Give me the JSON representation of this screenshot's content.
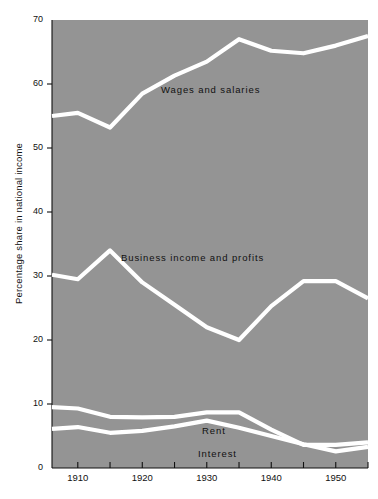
{
  "chart_data": {
    "type": "line",
    "title": "",
    "subtitle": "",
    "xlabel": "",
    "ylabel": "Percentage share in national income",
    "xlim": [
      1906,
      1955
    ],
    "ylim": [
      0,
      70
    ],
    "grid": false,
    "legend_position": "inline-annotations",
    "background_color": "#949494",
    "line_color": "#ffffff",
    "text_color": "#111111",
    "y_ticks": [
      0,
      10,
      20,
      30,
      40,
      50,
      60,
      70
    ],
    "y_tick_labels": [
      "0",
      "10",
      "20",
      "30",
      "40",
      "50",
      "60",
      "70"
    ],
    "x_ticks": [
      1910,
      1915,
      1920,
      1925,
      1930,
      1935,
      1940,
      1945,
      1950,
      1955
    ],
    "x_tick_labels_shown": [
      "1910",
      "1920",
      "1930",
      "1940",
      "1950"
    ],
    "x_labeled_ticks": [
      1910,
      1920,
      1930,
      1940,
      1950
    ],
    "series": [
      {
        "name": "Wages and salaries",
        "label": "Wages and salaries",
        "x": [
          1906,
          1910,
          1915,
          1920,
          1925,
          1930,
          1935,
          1940,
          1945,
          1950,
          1955
        ],
        "values": [
          55.0,
          55.5,
          53.2,
          58.5,
          61.3,
          63.5,
          67.0,
          65.2,
          64.8,
          66.0,
          67.5
        ]
      },
      {
        "name": "Business income and profits",
        "label": "Business income and profits",
        "x": [
          1906,
          1910,
          1915,
          1920,
          1925,
          1930,
          1935,
          1940,
          1945,
          1950,
          1955
        ],
        "values": [
          30.2,
          29.5,
          34.0,
          29.0,
          25.5,
          22.0,
          20.0,
          25.3,
          29.2,
          29.2,
          26.5
        ]
      },
      {
        "name": "Rent",
        "label": "Rent",
        "x": [
          1906,
          1910,
          1915,
          1920,
          1925,
          1930,
          1935,
          1940,
          1945,
          1950,
          1955
        ],
        "values": [
          9.5,
          9.3,
          8.0,
          7.9,
          8.0,
          8.7,
          8.7,
          6.0,
          3.6,
          3.6,
          4.0
        ]
      },
      {
        "name": "Interest",
        "label": "Interest",
        "x": [
          1906,
          1910,
          1915,
          1920,
          1925,
          1930,
          1935,
          1940,
          1945,
          1950,
          1955
        ],
        "values": [
          6.1,
          6.4,
          5.5,
          5.8,
          6.5,
          7.4,
          6.3,
          5.0,
          3.7,
          2.6,
          3.3
        ]
      }
    ]
  }
}
